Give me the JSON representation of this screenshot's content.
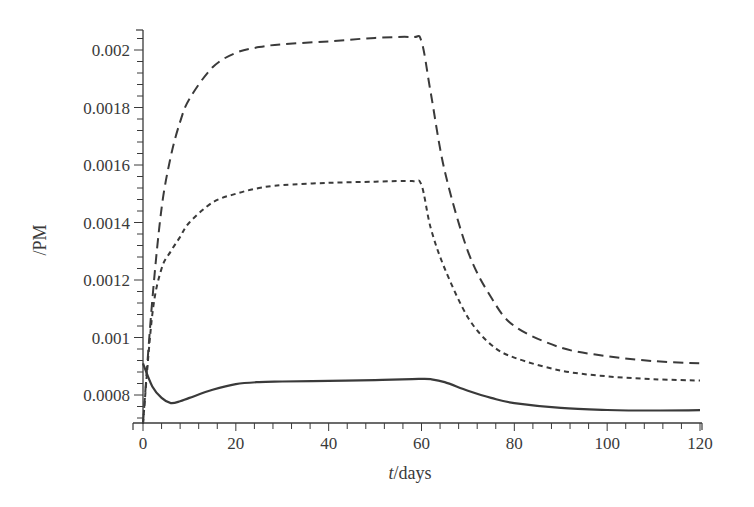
{
  "chart_data": {
    "type": "line",
    "title": "",
    "xlabel_italic": "t",
    "xlabel_rest": "/days",
    "xlabel": "t/days",
    "ylabel": "/PM",
    "xlim": [
      0,
      120
    ],
    "ylim": [
      0.0007,
      0.00207
    ],
    "grid": false,
    "legend": "none",
    "x_ticks": [
      0,
      20,
      40,
      60,
      80,
      100,
      120
    ],
    "x_tick_labels": [
      "0",
      "20",
      "40",
      "60",
      "80",
      "100",
      "120"
    ],
    "y_ticks": [
      0.0008,
      0.001,
      0.0012,
      0.0014,
      0.0016,
      0.0018,
      0.002
    ],
    "y_tick_labels": [
      "0.0008",
      "0.001",
      "0.0012",
      "0.0014",
      "0.0016",
      "0.0018",
      "0.002"
    ],
    "x": [
      0,
      2,
      4,
      6,
      8,
      10,
      15,
      20,
      25,
      30,
      40,
      50,
      58,
      60,
      62,
      65,
      70,
      75,
      80,
      90,
      100,
      110,
      120
    ],
    "series": [
      {
        "name": "long-dashed",
        "style": "long-dash",
        "values": [
          0.0007,
          0.00113,
          0.00145,
          0.00163,
          0.00175,
          0.00183,
          0.00194,
          0.00199,
          0.00201,
          0.00202,
          0.00203,
          0.002042,
          0.002045,
          0.00203,
          0.00185,
          0.00158,
          0.0013,
          0.00114,
          0.00104,
          0.000965,
          0.000935,
          0.000918,
          0.00091
        ]
      },
      {
        "name": "short-dashed",
        "style": "short-dash",
        "values": [
          0.0007,
          0.00108,
          0.00124,
          0.0013,
          0.00135,
          0.0014,
          0.00147,
          0.0015,
          0.00152,
          0.00153,
          0.001538,
          0.001542,
          0.001544,
          0.00153,
          0.00138,
          0.00124,
          0.00107,
          0.000975,
          0.00093,
          0.000885,
          0.000865,
          0.000855,
          0.00085
        ]
      },
      {
        "name": "solid",
        "style": "solid",
        "values": [
          0.00091,
          0.00083,
          0.00079,
          0.000772,
          0.000778,
          0.00079,
          0.000818,
          0.000838,
          0.000845,
          0.000847,
          0.000849,
          0.000852,
          0.000855,
          0.000856,
          0.000855,
          0.000845,
          0.000815,
          0.00079,
          0.000772,
          0.000755,
          0.000748,
          0.000746,
          0.000747
        ]
      }
    ]
  },
  "colors": {
    "line": "#3a3a3a",
    "axis": "#3a3a3a",
    "background": "#ffffff"
  }
}
